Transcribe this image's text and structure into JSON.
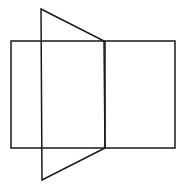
{
  "diagram": {
    "stroke_color": "#1a1a1a",
    "background_color": "#ffffff",
    "stroke_width": 1.5,
    "rectangle": {
      "x1": 11,
      "y1": 41,
      "x2": 175,
      "y2": 148,
      "divider_x": 105
    },
    "trapezoid": {
      "points": [
        [
          41,
          9
        ],
        [
          104,
          41
        ],
        [
          105,
          148
        ],
        [
          42,
          180
        ]
      ]
    }
  }
}
